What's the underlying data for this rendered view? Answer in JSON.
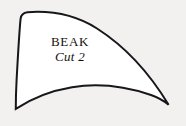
{
  "document": {
    "kind": "sewing-pattern-piece",
    "background_color": "#f2f1ef"
  },
  "pattern_piece": {
    "name": "beak-pattern-piece",
    "fill_color": "#ffffff",
    "outline_color": "#17161a",
    "outline_width": "2",
    "label": "BEAK",
    "cut_instruction": "Cut 2",
    "outline_path": "M 27.5 12.2 C 23.5 12.6 21.2 14.8 20.6 18.6 C 19.3 31.0 17.8 58.0 16.6 80.0 C 16.0 91.0 15.8 102.0 15.8 108.8 C 33.0 97.5 52.0 90.5 72.0 87.2 C 98.0 83.0 126.0 86.5 151.0 95.0 C 158.0 97.5 164.0 100.8 168.6 104.8 C 150.0 74.0 126.0 47.0 97.0 28.5 C 76.0 15.2 51.5 10.5 27.5 12.2 Z"
  }
}
